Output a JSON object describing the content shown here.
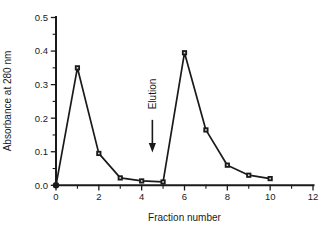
{
  "colors": {
    "ink": "#1a1a1a",
    "background": "#ffffff",
    "marker_center": "#d9d9d9"
  },
  "chart_data": {
    "type": "line",
    "title": "",
    "xlabel": "Fraction number",
    "ylabel": "Absorbance at 280 nm",
    "xlim": [
      0,
      12
    ],
    "ylim": [
      0.0,
      0.5
    ],
    "grid": "off",
    "legend": "none",
    "x_major_ticks": [
      0,
      2,
      4,
      6,
      8,
      10,
      12
    ],
    "x_minor_ticks": [
      1,
      3,
      5,
      7,
      9,
      11
    ],
    "x_tick_labels": [
      "0",
      "2",
      "4",
      "6",
      "8",
      "10",
      "12"
    ],
    "y_major_ticks": [
      0.0,
      0.1,
      0.2,
      0.3,
      0.4,
      0.5
    ],
    "y_minor_ticks": [
      0.05,
      0.15,
      0.25,
      0.35,
      0.45
    ],
    "y_tick_labels": [
      "0.0",
      "0.1",
      "0.2",
      "0.3",
      "0.4",
      "0.5"
    ],
    "series": [
      {
        "name": "absorbance",
        "marker": "square",
        "x": [
          0,
          1,
          2,
          3,
          4,
          5,
          6,
          7,
          8,
          9,
          10
        ],
        "y": [
          0.0,
          0.35,
          0.095,
          0.022,
          0.013,
          0.01,
          0.395,
          0.165,
          0.06,
          0.03,
          0.02
        ]
      }
    ],
    "annotation": {
      "label": "Elution",
      "x": 4.5,
      "arrow_from_y": 0.195,
      "arrow_to_y": 0.105
    }
  }
}
